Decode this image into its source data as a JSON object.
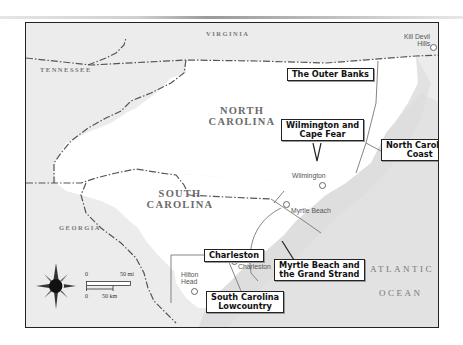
{
  "map": {
    "states": {
      "virginia": "VIRGINIA",
      "tennessee": "TENNESSEE",
      "north_carolina": "NORTH CAROLINA",
      "south_carolina": "SOUTH CAROLINA",
      "georgia": "GEORGIA"
    },
    "ocean": {
      "line1": "ATLANTIC",
      "line2": "OCEAN"
    },
    "regions": {
      "outer_banks": "The Outer Banks",
      "wilmington_cape_fear_1": "Wilmington and",
      "wilmington_cape_fear_2": "Cape Fear",
      "nc_coast_1": "North Carolina",
      "nc_coast_2": "Coast",
      "charleston": "Charleston",
      "myrtle_beach_1": "Myrtle Beach and",
      "myrtle_beach_2": "the Grand Strand",
      "sc_lowcountry_1": "South Carolina",
      "sc_lowcountry_2": "Lowcountry"
    },
    "towns": {
      "kill_devil_1": "Kill Devil",
      "kill_devil_2": "Hills",
      "wilmington": "Wilmington",
      "myrtle_beach": "Myrtle Beach",
      "charleston": "Charleston",
      "hilton_1": "Hilton",
      "hilton_2": "Head"
    },
    "scale": {
      "mi_zero": "0",
      "mi_label": "50 mi",
      "km_zero": "0",
      "km_label": "50 km"
    },
    "colors": {
      "land_focus": "#ffffff",
      "land_other": "#e9e9e9",
      "ocean": "#e2e2e2",
      "border": "#222222"
    }
  }
}
